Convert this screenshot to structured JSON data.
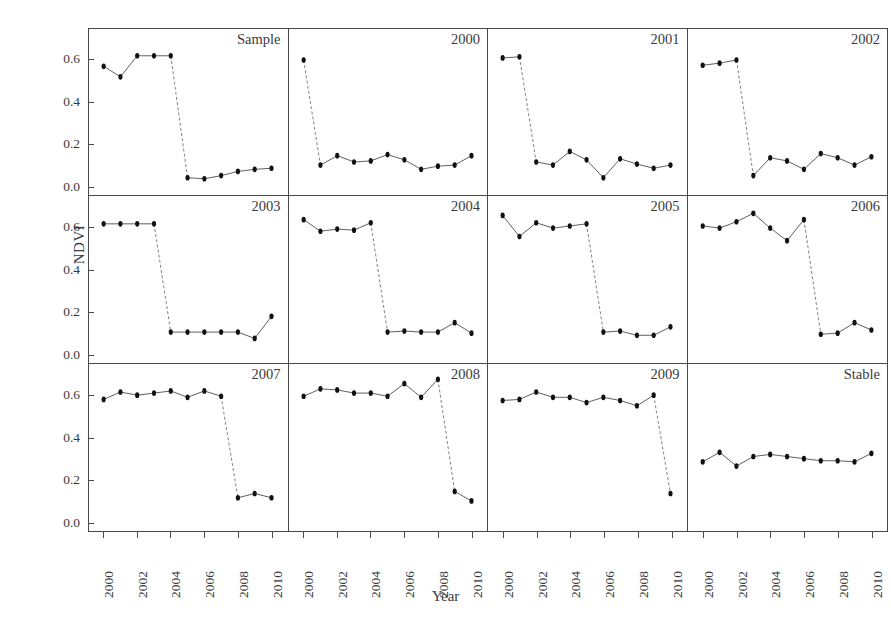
{
  "chart_data": {
    "type": "line",
    "title": "",
    "xlabel": "Year",
    "ylabel": "NDVI",
    "xlim": [
      1999.6,
      2010.6
    ],
    "ylim": [
      -0.02,
      0.7
    ],
    "yticks": [
      0.0,
      0.2,
      0.4,
      0.6
    ],
    "ytick_labels": [
      "0.0",
      "0.2",
      "0.4",
      "0.6"
    ],
    "xticks": [
      2000,
      2002,
      2004,
      2006,
      2008,
      2010
    ],
    "xtick_labels": [
      "2000",
      "2002",
      "2004",
      "2006",
      "2008",
      "2010"
    ],
    "grid": false,
    "legend": null,
    "layout": {
      "rows": 3,
      "cols": 4,
      "shared_x": true,
      "shared_y": true
    },
    "marker": "filled-circle",
    "line_style_pre_post": "solid",
    "line_style_break": "dashed",
    "note": "Small-multiple NDVI time series; dashed segment marks the disturbance/break transition",
    "panels": [
      {
        "label": "Sample",
        "break_after_index": 4,
        "x": [
          2000,
          2001,
          2002,
          2003,
          2004,
          2005,
          2006,
          2007,
          2008,
          2009,
          2010
        ],
        "y": [
          0.57,
          0.52,
          0.62,
          0.62,
          0.62,
          0.04,
          0.035,
          0.05,
          0.07,
          0.08,
          0.085
        ]
      },
      {
        "label": "2000",
        "break_after_index": 0,
        "x": [
          2000,
          2001,
          2002,
          2003,
          2004,
          2005,
          2006,
          2007,
          2008,
          2009,
          2010
        ],
        "y": [
          0.6,
          0.1,
          0.145,
          0.115,
          0.12,
          0.15,
          0.125,
          0.08,
          0.095,
          0.1,
          0.145
        ]
      },
      {
        "label": "2001",
        "break_after_index": 1,
        "x": [
          2000,
          2001,
          2002,
          2003,
          2004,
          2005,
          2006,
          2007,
          2008,
          2009,
          2010
        ],
        "y": [
          0.61,
          0.615,
          0.115,
          0.1,
          0.165,
          0.125,
          0.04,
          0.13,
          0.105,
          0.085,
          0.1
        ]
      },
      {
        "label": "2002",
        "break_after_index": 2,
        "x": [
          2000,
          2001,
          2002,
          2003,
          2004,
          2005,
          2006,
          2007,
          2008,
          2009,
          2010
        ],
        "y": [
          0.575,
          0.585,
          0.6,
          0.05,
          0.135,
          0.12,
          0.08,
          0.155,
          0.135,
          0.1,
          0.14
        ]
      },
      {
        "label": "2003",
        "break_after_index": 3,
        "x": [
          2000,
          2001,
          2002,
          2003,
          2004,
          2005,
          2006,
          2007,
          2008,
          2009,
          2010
        ],
        "y": [
          0.615,
          0.615,
          0.615,
          0.615,
          0.1,
          0.1,
          0.1,
          0.1,
          0.1,
          0.07,
          0.175
        ]
      },
      {
        "label": "2004",
        "break_after_index": 4,
        "x": [
          2000,
          2001,
          2002,
          2003,
          2004,
          2005,
          2006,
          2007,
          2008,
          2009,
          2010
        ],
        "y": [
          0.635,
          0.58,
          0.59,
          0.585,
          0.62,
          0.1,
          0.105,
          0.1,
          0.1,
          0.145,
          0.095
        ]
      },
      {
        "label": "2005",
        "break_after_index": 5,
        "x": [
          2000,
          2001,
          2002,
          2003,
          2004,
          2005,
          2006,
          2007,
          2008,
          2009,
          2010
        ],
        "y": [
          0.655,
          0.555,
          0.62,
          0.595,
          0.605,
          0.615,
          0.1,
          0.105,
          0.085,
          0.085,
          0.125
        ]
      },
      {
        "label": "2006",
        "break_after_index": 6,
        "x": [
          2000,
          2001,
          2002,
          2003,
          2004,
          2005,
          2006,
          2007,
          2008,
          2009,
          2010
        ],
        "y": [
          0.605,
          0.595,
          0.625,
          0.665,
          0.595,
          0.535,
          0.635,
          0.09,
          0.095,
          0.145,
          0.11
        ]
      },
      {
        "label": "2007",
        "break_after_index": 7,
        "x": [
          2000,
          2001,
          2002,
          2003,
          2004,
          2005,
          2006,
          2007,
          2008,
          2009,
          2010
        ],
        "y": [
          0.58,
          0.615,
          0.6,
          0.61,
          0.62,
          0.59,
          0.62,
          0.595,
          0.115,
          0.135,
          0.115
        ]
      },
      {
        "label": "2008",
        "break_after_index": 8,
        "x": [
          2000,
          2001,
          2002,
          2003,
          2004,
          2005,
          2006,
          2007,
          2008,
          2009,
          2010
        ],
        "y": [
          0.595,
          0.63,
          0.625,
          0.61,
          0.61,
          0.595,
          0.655,
          0.59,
          0.675,
          0.145,
          0.1
        ]
      },
      {
        "label": "2009",
        "break_after_index": 9,
        "x": [
          2000,
          2001,
          2002,
          2003,
          2004,
          2005,
          2006,
          2007,
          2008,
          2009,
          2010
        ],
        "y": [
          0.575,
          0.58,
          0.615,
          0.59,
          0.59,
          0.565,
          0.59,
          0.575,
          0.55,
          0.6,
          0.135
        ]
      },
      {
        "label": "Stable",
        "break_after_index": null,
        "x": [
          2000,
          2001,
          2002,
          2003,
          2004,
          2005,
          2006,
          2007,
          2008,
          2009,
          2010
        ],
        "y": [
          0.285,
          0.33,
          0.265,
          0.31,
          0.32,
          0.31,
          0.3,
          0.29,
          0.29,
          0.285,
          0.325
        ]
      }
    ]
  },
  "style": {
    "line_color": "#1a1a1a",
    "marker_color": "#111111",
    "axis_color": "#4a4a4a",
    "text_color": "#3a3a3a",
    "background": "#ffffff"
  }
}
